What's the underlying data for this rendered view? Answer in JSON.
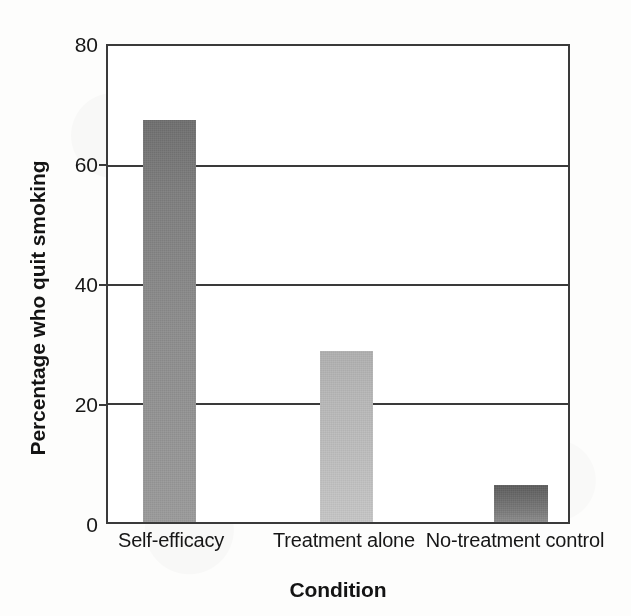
{
  "chart_data": {
    "type": "bar",
    "title": "",
    "subtitle": "",
    "xlabel": "Condition",
    "ylabel": "Percentage who quit smoking",
    "categories": [
      "Self-efficacy",
      "Treatment alone",
      "No-treatment control"
    ],
    "values": [
      67.5,
      28.7,
      6.2
    ],
    "series": [
      {
        "name": "Percentage who quit smoking",
        "values": [
          67.5,
          28.7,
          6.2
        ]
      }
    ],
    "ylim": [
      0,
      80
    ],
    "yticks": [
      0,
      20,
      40,
      60,
      80
    ],
    "ytick_labels": [
      "0",
      "20",
      "40",
      "60",
      "80"
    ],
    "xtick_labels": [
      "Self-efficacy",
      "Treatment alone",
      "No-treatment control"
    ],
    "grid": true,
    "grid_axis": "y",
    "legend": false,
    "legend_position": "none",
    "bar_colors": [
      "#8a8a8a",
      "#b9b9b9",
      "#6f6f6f"
    ],
    "bar_color_top": [
      "#6f6f6f",
      "#b3b3b3",
      "#5e5e5e"
    ],
    "bar_color_bottom": [
      "#9a9a9a",
      "#c2c2c2",
      "#8c8c8c"
    ],
    "axis_color": "#3a3a3a",
    "background_color": "#ffffff",
    "text_color": "#171717",
    "annotations": []
  },
  "axes": {
    "y_ticks": [
      {
        "label": "80",
        "value": 80
      },
      {
        "label": "60",
        "value": 60
      },
      {
        "label": "40",
        "value": 40
      },
      {
        "label": "20",
        "value": 20
      },
      {
        "label": "0",
        "value": 0
      }
    ],
    "x_ticks": [
      {
        "label": "Self-efficacy"
      },
      {
        "label": "Treatment alone"
      },
      {
        "label": "No-treatment control"
      }
    ],
    "y_title": "Percentage who quit smoking",
    "x_title": "Condition"
  },
  "bars": [
    {
      "label": "Self-efficacy",
      "value": 67.5,
      "value_text": "67.5"
    },
    {
      "label": "Treatment alone",
      "value": 28.7,
      "value_text": "28.7"
    },
    {
      "label": "No-treatment control",
      "value": 6.2,
      "value_text": "6.2"
    }
  ]
}
